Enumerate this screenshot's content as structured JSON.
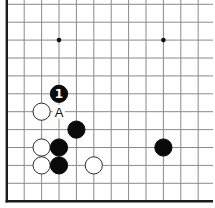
{
  "diagram": {
    "board_colors": {
      "background": "#ffffff",
      "line": "#8a8a8a",
      "edge": "#1a1a1a",
      "black_stone": "#0a0a0a",
      "white_stone": "#ffffff"
    },
    "visible_columns": 12,
    "visible_rows": 12,
    "edges": [
      "left",
      "bottom"
    ],
    "star_points": [
      {
        "col": 3,
        "row": 9
      },
      {
        "col": 9,
        "row": 9
      }
    ],
    "stones": [
      {
        "color": "black",
        "col": 3,
        "row": 6,
        "label": "1"
      },
      {
        "color": "white",
        "col": 2,
        "row": 5,
        "label": ""
      },
      {
        "color": "black",
        "col": 4,
        "row": 4,
        "label": ""
      },
      {
        "color": "white",
        "col": 2,
        "row": 3,
        "label": ""
      },
      {
        "color": "black",
        "col": 3,
        "row": 3,
        "label": ""
      },
      {
        "color": "white",
        "col": 2,
        "row": 2,
        "label": ""
      },
      {
        "color": "black",
        "col": 3,
        "row": 2,
        "label": ""
      },
      {
        "color": "white",
        "col": 5,
        "row": 2,
        "label": ""
      },
      {
        "color": "black",
        "col": 9,
        "row": 3,
        "label": ""
      }
    ],
    "point_labels": [
      {
        "col": 3,
        "row": 5,
        "text": "A"
      }
    ]
  }
}
